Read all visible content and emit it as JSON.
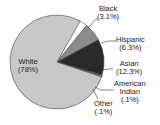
{
  "chart_data": {
    "type": "pie",
    "title": "",
    "categories": [
      "White",
      "Black",
      "Hispanic",
      "Asian",
      "American Indian",
      "Other"
    ],
    "values": [
      78,
      3.1,
      6.3,
      12.3,
      0.1,
      0.1
    ],
    "value_labels": [
      "(78%)",
      "(3.1%)",
      "(6.3%)",
      "(12.3%)",
      "(.1%)",
      "(.1%)"
    ],
    "colors": [
      "#c8c8c8",
      "#ffffff",
      "#8c8c8c",
      "#2a2a2a",
      "#6a6a6a",
      "#b0b0b0"
    ],
    "legend": "none (leader-line labels)"
  },
  "labels": {
    "white": {
      "name": "White",
      "pct": "(78%)"
    },
    "black": {
      "name": "Black",
      "pct": "(3.1%)"
    },
    "hispanic": {
      "name": "Hispanic",
      "pct": "(6.3%)"
    },
    "asian": {
      "name": "Asian",
      "pct": "(12.3%)"
    },
    "american_indian": {
      "name1": "American",
      "name2": "Indian",
      "pct": "(.1%)"
    },
    "other": {
      "name": "Other",
      "pct": "(.1%)"
    }
  }
}
